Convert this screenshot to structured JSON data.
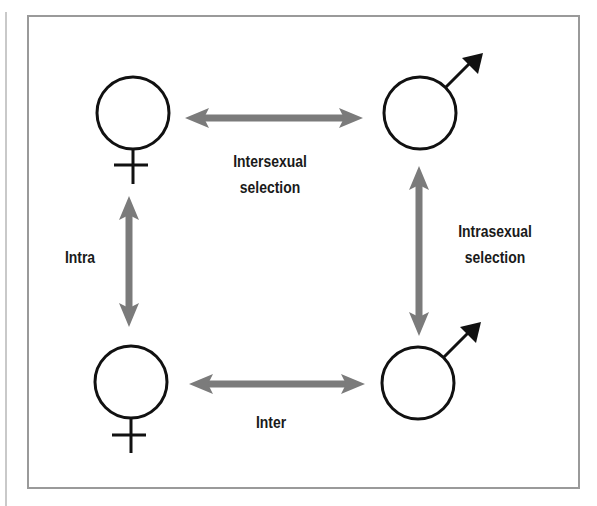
{
  "diagram": {
    "colors": {
      "arrow": "#7b7b7b",
      "symbol": "#111111",
      "frame": "#9a9a9a",
      "text": "#1a1a1a"
    },
    "nodes": [
      {
        "id": "female-top",
        "symbol": "female-symbol",
        "position": "top-left"
      },
      {
        "id": "male-top",
        "symbol": "male-symbol",
        "position": "top-right"
      },
      {
        "id": "female-bottom",
        "symbol": "female-symbol",
        "position": "bottom-left"
      },
      {
        "id": "male-bottom",
        "symbol": "male-symbol",
        "position": "bottom-right"
      }
    ],
    "edges": [
      {
        "from": "female-top",
        "to": "male-top",
        "type": "double-arrow",
        "label_line1": "Intersexual",
        "label_line2": "selection"
      },
      {
        "from": "male-top",
        "to": "male-bottom",
        "type": "double-arrow",
        "label_line1": "Intrasexual",
        "label_line2": "selection"
      },
      {
        "from": "female-top",
        "to": "female-bottom",
        "type": "double-arrow",
        "label": "Intra"
      },
      {
        "from": "female-bottom",
        "to": "male-bottom",
        "type": "double-arrow",
        "label": "Inter"
      }
    ]
  },
  "labels": {
    "intersexual_line1": "Intersexual",
    "intersexual_line2": "selection",
    "intrasexual_line1": "Intrasexual",
    "intrasexual_line2": "selection",
    "intra": "Intra",
    "inter": "Inter"
  }
}
